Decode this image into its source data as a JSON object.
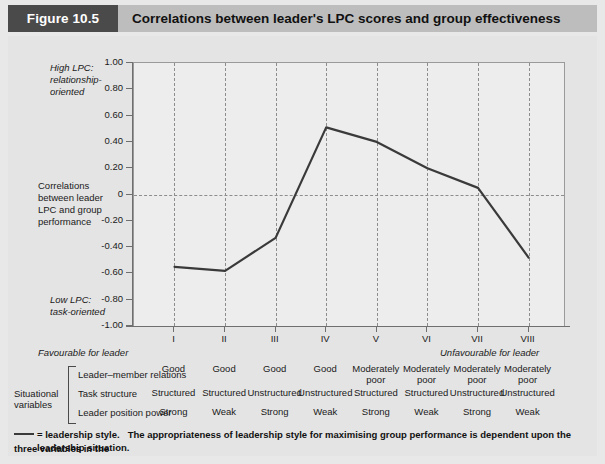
{
  "header": {
    "figure_tag": "Figure 10.5",
    "title": "Correlations between leader's LPC scores and group effectiveness"
  },
  "annotations": {
    "high_lpc": "High LPC:\nrelationship-\noriented",
    "y_axis_caption": "Correlations\nbetween leader\nLPC and group\nperformance",
    "low_lpc": "Low LPC:\ntask-oriented",
    "favourable": "Favourable for leader",
    "unfavourable": "Unfavourable for leader"
  },
  "situational": {
    "group_label": "Situational\nvariables",
    "rows": [
      {
        "name": "Leader–member relations",
        "values": [
          "Good",
          "Good",
          "Good",
          "Good",
          "Moderately\npoor",
          "Moderately\npoor",
          "Moderately\npoor",
          "Moderately\npoor"
        ]
      },
      {
        "name": "Task structure",
        "values": [
          "Structured",
          "Structured",
          "Unstructured",
          "Unstructured",
          "Structured",
          "Structured",
          "Unstructured",
          "Unstructured"
        ]
      },
      {
        "name": "Leader position power",
        "values": [
          "Strong",
          "Weak",
          "Strong",
          "Weak",
          "Strong",
          "Weak",
          "Strong",
          "Weak"
        ]
      }
    ]
  },
  "footnote": {
    "legend_text": "= leadership style.",
    "line1": "The appropriateness of leadership style for maximising group performance is dependent upon the three variables in the",
    "line2": "leadership situation."
  },
  "colors": {
    "tag_background": "#4a4a4a",
    "header_background": "#bdbdbd",
    "panel_background": "#e4e4e4",
    "plot_background": "#ededed",
    "line_color": "#3a3a3a",
    "grid_color": "#8d8d8d",
    "axis_color": "#6f6f6f"
  },
  "chart_data": {
    "type": "line",
    "title": "Correlations between leader's LPC scores and group effectiveness",
    "xlabel": "",
    "ylabel": "Correlations between leader LPC and group performance",
    "categories": [
      "I",
      "II",
      "III",
      "IV",
      "V",
      "VI",
      "VII",
      "VIII"
    ],
    "values": [
      -0.55,
      -0.58,
      -0.33,
      0.51,
      0.4,
      0.2,
      0.05,
      -0.48
    ],
    "series": [
      {
        "name": "leadership style",
        "values": [
          -0.55,
          -0.58,
          -0.33,
          0.51,
          0.4,
          0.2,
          0.05,
          -0.48
        ]
      }
    ],
    "ylim": [
      -1.0,
      1.0
    ],
    "yticks": [
      1.0,
      0.8,
      0.6,
      0.4,
      0.2,
      0,
      -0.2,
      -0.4,
      -0.6,
      -0.8,
      -1.0
    ],
    "ytick_labels": [
      "1.00",
      "0.80",
      "0.60",
      "0.40",
      "0.20",
      "0",
      "-0.20",
      "-0.40",
      "-0.60",
      "-0.80",
      "-1.00"
    ],
    "grid": "vertical-dashed-plus-zero-line",
    "legend": "none"
  }
}
